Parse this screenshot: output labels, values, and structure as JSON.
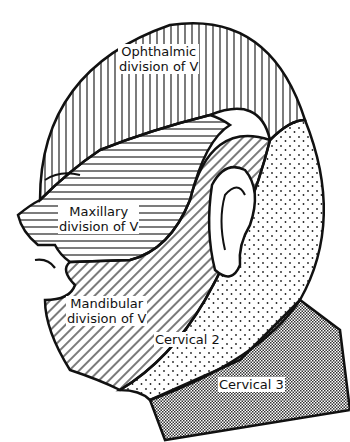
{
  "diagram": {
    "regions": [
      {
        "id": "ophthalmic",
        "label_line1": "Ophthalmic",
        "label_line2": "division of V",
        "pattern": "vertical-lines"
      },
      {
        "id": "maxillary",
        "label_line1": "Maxillary",
        "label_line2": "division of V",
        "pattern": "horizontal-lines"
      },
      {
        "id": "mandibular",
        "label_line1": "Mandibular",
        "label_line2": "division of V",
        "pattern": "diagonal-lines"
      },
      {
        "id": "cervical2",
        "label_line1": "Cervical 2",
        "pattern": "sparse-dots"
      },
      {
        "id": "cervical3",
        "label_line1": "Cervical 3",
        "pattern": "dense-stipple"
      }
    ]
  }
}
